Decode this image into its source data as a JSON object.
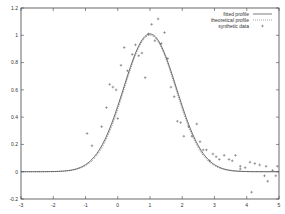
{
  "chart_data": {
    "type": "line",
    "title": "",
    "xlabel": "",
    "ylabel": "",
    "xlim": [
      -3,
      5
    ],
    "ylim": [
      -0.2,
      1.2
    ],
    "x_ticks": [
      "-3",
      "-2",
      "-1",
      "0",
      "1",
      "2",
      "3",
      "4",
      "5"
    ],
    "y_ticks": [
      "-0.2",
      "0",
      "0.2",
      "0.4",
      "0.6",
      "0.8",
      "1",
      "1.2"
    ],
    "grid": false,
    "legend_position": "top-right",
    "legend": [
      "fitted profile",
      "theoretical profile",
      "synthetic data"
    ],
    "series": [
      {
        "name": "fitted profile",
        "style": "solid",
        "model": "gaussian",
        "amplitude": 1.01,
        "center": 1.0,
        "sigma": 0.82,
        "offset": 0.0
      },
      {
        "name": "theoretical profile",
        "style": "dotted",
        "model": "gaussian",
        "amplitude": 1.0,
        "center": 1.0,
        "sigma": 0.8,
        "offset": 0.0
      },
      {
        "name": "synthetic data",
        "style": "plus-markers",
        "points": [
          [
            -0.95,
            0.28
          ],
          [
            -0.8,
            0.19
          ],
          [
            -0.5,
            0.33
          ],
          [
            -0.35,
            0.47
          ],
          [
            -0.25,
            0.64
          ],
          [
            -0.15,
            0.62
          ],
          [
            -0.05,
            0.6
          ],
          [
            0.0,
            0.39
          ],
          [
            0.1,
            0.78
          ],
          [
            0.2,
            0.91
          ],
          [
            0.3,
            0.74
          ],
          [
            0.45,
            0.86
          ],
          [
            0.55,
            0.93
          ],
          [
            0.65,
            0.85
          ],
          [
            0.75,
            0.87
          ],
          [
            0.85,
            0.69
          ],
          [
            0.95,
            1.01
          ],
          [
            1.05,
            1.08
          ],
          [
            1.15,
            0.96
          ],
          [
            1.25,
            1.12
          ],
          [
            1.35,
            0.94
          ],
          [
            1.45,
            1.02
          ],
          [
            1.55,
            0.83
          ],
          [
            1.65,
            0.62
          ],
          [
            1.75,
            0.55
          ],
          [
            1.85,
            0.37
          ],
          [
            1.95,
            0.36
          ],
          [
            2.05,
            0.26
          ],
          [
            2.2,
            0.33
          ],
          [
            2.3,
            0.26
          ],
          [
            2.45,
            0.35
          ],
          [
            2.55,
            0.22
          ],
          [
            2.65,
            0.16
          ],
          [
            2.75,
            0.16
          ],
          [
            2.85,
            0.08
          ],
          [
            2.95,
            0.13
          ],
          [
            3.05,
            0.11
          ],
          [
            3.15,
            0.09
          ],
          [
            3.3,
            0.12
          ],
          [
            3.45,
            0.09
          ],
          [
            3.55,
            0.08
          ],
          [
            3.65,
            0.12
          ],
          [
            3.8,
            0.04
          ],
          [
            3.95,
            0.03
          ],
          [
            4.1,
            0.07
          ],
          [
            4.25,
            0.06
          ],
          [
            4.4,
            0.05
          ],
          [
            4.55,
            -0.03
          ],
          [
            4.65,
            -0.07
          ],
          [
            4.8,
            0.01
          ],
          [
            4.9,
            -0.03
          ],
          [
            4.95,
            0.04
          ],
          [
            3.8,
            0.02
          ],
          [
            4.15,
            -0.15
          ],
          [
            4.6,
            0.04
          ]
        ]
      }
    ]
  },
  "plot": {
    "frame_color": "#444444",
    "fitted_color": "#555555",
    "theoretical_color": "#555555",
    "marker_color": "#666666"
  }
}
